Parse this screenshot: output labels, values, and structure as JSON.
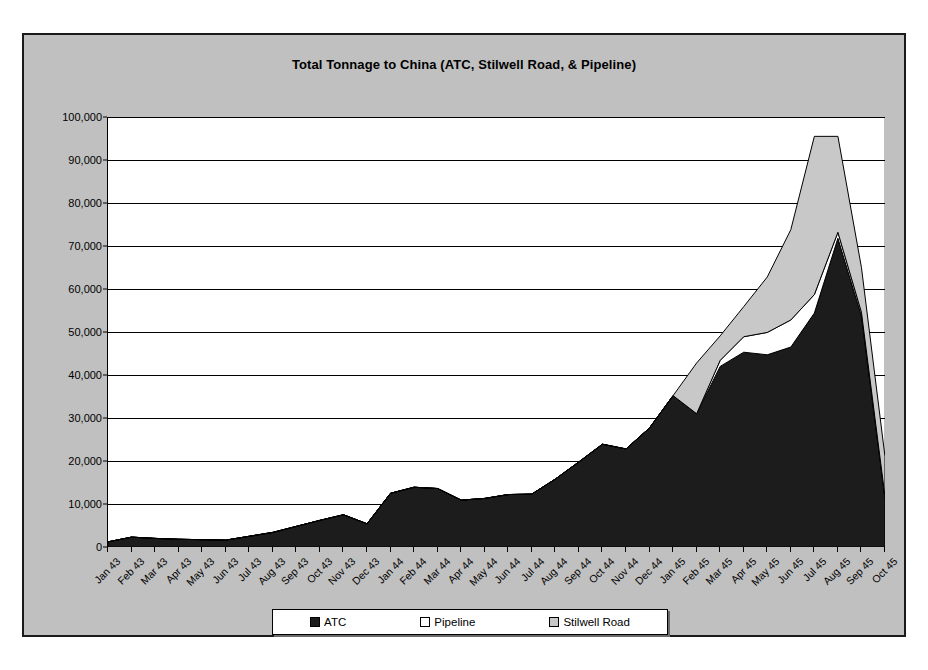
{
  "chart_data": {
    "type": "area",
    "stacked": true,
    "title": "Total Tonnage to China (ATC, Stilwell Road, & Pipeline)",
    "xlabel": "",
    "ylabel": "",
    "ylim": [
      0,
      100000
    ],
    "ytick_step": 10000,
    "ytick_labels": [
      "0",
      "10,000",
      "20,000",
      "30,000",
      "40,000",
      "50,000",
      "60,000",
      "70,000",
      "80,000",
      "90,000",
      "100,000"
    ],
    "ytick_values": [
      0,
      10000,
      20000,
      30000,
      40000,
      50000,
      60000,
      70000,
      80000,
      90000,
      100000
    ],
    "grid": "horizontal",
    "legend_position": "bottom",
    "categories": [
      "Jan 43",
      "Feb 43",
      "Mar 43",
      "Apr 43",
      "May 43",
      "Jun 43",
      "Jul 43",
      "Aug 43",
      "Sep 43",
      "Oct 43",
      "Nov 43",
      "Dec 43",
      "Jan 44",
      "Feb 44",
      "Mar 44",
      "Apr 44",
      "May 44",
      "Jun 44",
      "Jul 44",
      "Aug 44",
      "Sep 44",
      "Oct 44",
      "Nov 44",
      "Dec 44",
      "Jan 45",
      "Feb 45",
      "Mar 45",
      "Apr 45",
      "May 45",
      "Jun 45",
      "Jul 45",
      "Aug 45",
      "Sep 45",
      "Oct 45"
    ],
    "series": [
      {
        "name": "ATC",
        "color": "#1c1c1c",
        "values": [
          1200,
          2300,
          2000,
          1800,
          1700,
          1600,
          2500,
          3400,
          4800,
          6200,
          7500,
          5400,
          12500,
          13900,
          13600,
          10900,
          11300,
          12200,
          12300,
          15800,
          19800,
          23900,
          22800,
          27700,
          35200,
          31000,
          42000,
          45300,
          44700,
          46500,
          54400,
          71800,
          53700,
          11300
        ]
      },
      {
        "name": "Pipeline",
        "color": "#ffffff",
        "values": [
          0,
          0,
          0,
          0,
          0,
          0,
          0,
          0,
          0,
          0,
          0,
          0,
          0,
          0,
          0,
          0,
          0,
          0,
          0,
          0,
          0,
          0,
          0,
          0,
          0,
          0,
          1400,
          3600,
          5200,
          6300,
          4300,
          1400,
          900,
          400
        ]
      },
      {
        "name": "Stilwell Road",
        "color": "#c8c8c8",
        "values": [
          0,
          0,
          0,
          0,
          0,
          0,
          0,
          0,
          0,
          0,
          0,
          0,
          0,
          0,
          0,
          0,
          0,
          0,
          0,
          0,
          0,
          0,
          0,
          0,
          0,
          11800,
          5700,
          7000,
          12900,
          21000,
          36800,
          22300,
          10400,
          9300
        ]
      }
    ],
    "totals": [
      1200,
      2300,
      2000,
      1800,
      1700,
      1600,
      2500,
      3400,
      4800,
      6200,
      7500,
      5400,
      12500,
      13900,
      13600,
      10900,
      11300,
      12200,
      12300,
      15800,
      19800,
      23900,
      22800,
      27700,
      35200,
      42800,
      49100,
      55900,
      62800,
      73800,
      95500,
      95500,
      65000,
      21000
    ],
    "peak": {
      "category": "Jul 45",
      "value": 95500
    }
  },
  "legend": {
    "entries": [
      {
        "label": "ATC",
        "color": "#1c1c1c"
      },
      {
        "label": "Pipeline",
        "color": "#ffffff"
      },
      {
        "label": "Stilwell Road",
        "color": "#c8c8c8"
      }
    ]
  },
  "colors": {
    "frame_background": "#c0c0c0",
    "plot_background": "#ffffff",
    "axis": "#000000",
    "gridline": "#000000",
    "outline": "#1a1a1a"
  }
}
